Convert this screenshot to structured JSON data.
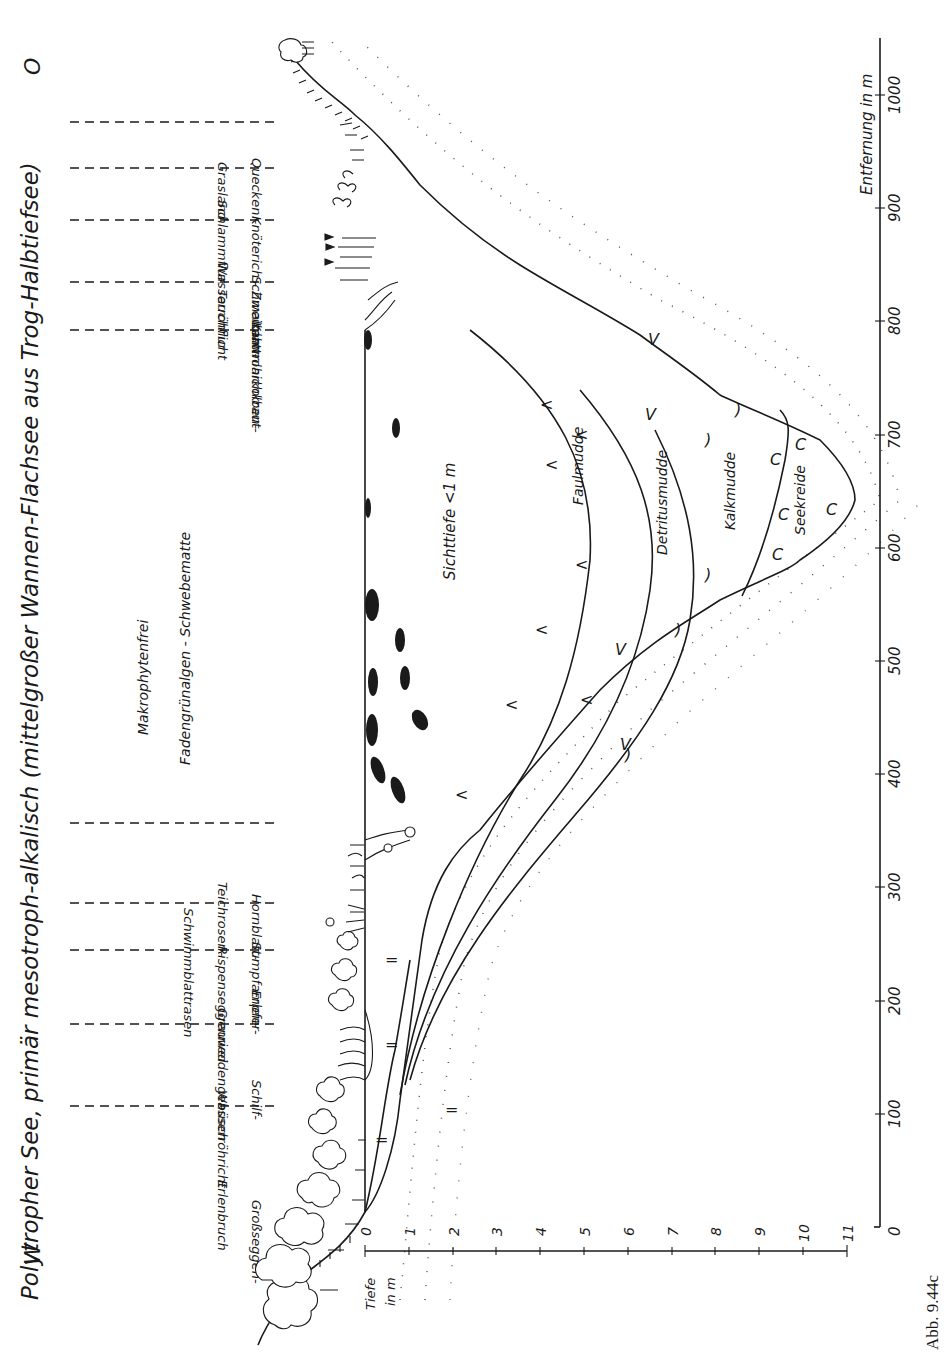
{
  "title": "Polytropher See, primär mesotroph-alkalisch (mittelgroßer Wannen-Flachsee aus Trog-Halbtiefsee)",
  "compass": {
    "west": "W",
    "east": "O"
  },
  "caption": "Abb. 9.44c",
  "axes": {
    "distance": {
      "label": "Entfernung in m",
      "ticks": [
        "0",
        "100",
        "200",
        "300",
        "400",
        "500",
        "600",
        "700",
        "800",
        "900",
        "1000"
      ]
    },
    "depth": {
      "label_line1": "Tiefe",
      "label_line2": "in m",
      "ticks": [
        "0",
        "1",
        "2",
        "3",
        "4",
        "5",
        "6",
        "7",
        "8",
        "9",
        "10",
        "11"
      ]
    }
  },
  "zones_west": [
    {
      "line1": "Großseggen-",
      "line2": "Erlenbruch"
    },
    {
      "line1": "Schilf-",
      "line2": "Wasserröhricht"
    },
    {
      "line1": "Erlen-",
      "line2": "Grauweidengebüsch"
    },
    {
      "line1": "Sumpfampfer-",
      "line2": "Rispenseggenried"
    },
    {
      "line1": "Hornblatt-",
      "line2": "Teichrosen-",
      "line3": "Schwimmblattrasen"
    }
  ],
  "zones_center": {
    "line1": "Makrophytenfrei",
    "line2": "Fadengrünalgen - Schwebematte"
  },
  "zones_east": [
    {
      "line1": "Kammlaichkraut-",
      "line2": "Tauchflur"
    },
    {
      "line1": "Schmalblattrohrkolben-",
      "line2": "Wasserröhricht"
    },
    {
      "line1": "Knöterich - Zweizahn-",
      "line2": "Schlammflur"
    },
    {
      "line1": "Quecken -",
      "line2": "Grasland"
    }
  ],
  "water": {
    "secchi_label": "Sichttiefe <1 m"
  },
  "sediments": [
    {
      "name": "Faulmudde",
      "symbol": "<"
    },
    {
      "name": "Detritusmudde",
      "symbol": "V"
    },
    {
      "name": "Kalkmudde",
      "symbol": ")"
    },
    {
      "name": "Seekreide",
      "symbol": "C"
    }
  ],
  "littoral_sediment_symbol": "="
}
